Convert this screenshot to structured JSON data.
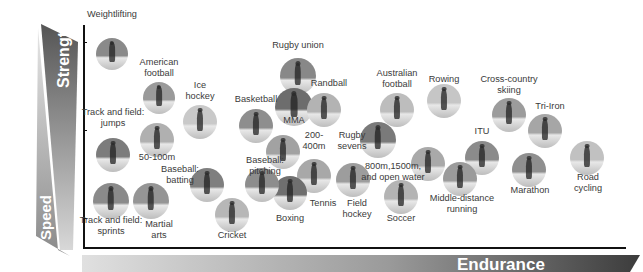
{
  "axes": {
    "y_top_label": "Strength",
    "y_bottom_label": "Speed",
    "x_label": "Endurance"
  },
  "sports": [
    {
      "id": "weightlifting",
      "label": "Weightlifting",
      "cx": 112,
      "cy": 54,
      "r": 16,
      "tone": "#8a8a8a"
    },
    {
      "id": "american-football",
      "label": "American\nfootball",
      "cx": 159,
      "cy": 98,
      "r": 16,
      "tone": "#9a9a9a"
    },
    {
      "id": "ice-hockey",
      "label": "Ice\nhockey",
      "cx": 200,
      "cy": 122,
      "r": 17,
      "tone": "#c9c9c9"
    },
    {
      "id": "track-field-jumps",
      "label": "Track and field:\njumps",
      "cx": 113,
      "cy": 155,
      "r": 17,
      "tone": "#7c7c7c"
    },
    {
      "id": "50-100m",
      "label": "50-100m",
      "cx": 157,
      "cy": 140,
      "r": 17,
      "tone": "#b0b0b0"
    },
    {
      "id": "basketball",
      "label": "Basketball",
      "cx": 256,
      "cy": 126,
      "r": 17,
      "tone": "#8e8e8e"
    },
    {
      "id": "rugby-union",
      "label": "Rugby union",
      "cx": 298,
      "cy": 76,
      "r": 18,
      "tone": "#888888"
    },
    {
      "id": "mma",
      "label": "MMA",
      "cx": 294,
      "cy": 107,
      "r": 19,
      "tone": "#6d6d6d"
    },
    {
      "id": "randball",
      "label": "Randball",
      "cx": 324,
      "cy": 110,
      "r": 17,
      "tone": "#b3b3b3"
    },
    {
      "id": "200-400m",
      "label": "200-\n400m",
      "cx": 283,
      "cy": 152,
      "r": 17,
      "tone": "#a2a2a2"
    },
    {
      "id": "rugby-sevens",
      "label": "Rugby\nsevens",
      "cx": 378,
      "cy": 140,
      "r": 18,
      "tone": "#7a7a7a"
    },
    {
      "id": "australian-football",
      "label": "Australian\nfootball",
      "cx": 397,
      "cy": 110,
      "r": 17,
      "tone": "#bdbdbd"
    },
    {
      "id": "rowing",
      "label": "Rowing",
      "cx": 444,
      "cy": 101,
      "r": 17,
      "tone": "#c6c6c6"
    },
    {
      "id": "cross-country-skiing",
      "label": "Cross-country\nskiing",
      "cx": 509,
      "cy": 115,
      "r": 17,
      "tone": "#9c9c9c"
    },
    {
      "id": "tri-iron",
      "label": "Tri-Iron",
      "cx": 545,
      "cy": 131,
      "r": 17,
      "tone": "#a6a6a6"
    },
    {
      "id": "road-cycling",
      "label": "Road\ncycling",
      "cx": 587,
      "cy": 158,
      "r": 17,
      "tone": "#c1c1c1"
    },
    {
      "id": "marathon",
      "label": "Marathon",
      "cx": 529,
      "cy": 170,
      "r": 17,
      "tone": "#8f8f8f"
    },
    {
      "id": "itu",
      "label": "ITU",
      "cx": 482,
      "cy": 158,
      "r": 17,
      "tone": "#8b8b8b"
    },
    {
      "id": "middle-distance-running",
      "label": "Middle-distance\nrunning",
      "cx": 460,
      "cy": 179,
      "r": 17,
      "tone": "#9b9b9b"
    },
    {
      "id": "800m-1500m-open-water",
      "label": "800m,1500m,\nand open water",
      "cx": 428,
      "cy": 164,
      "r": 17,
      "tone": "#a9a9a9"
    },
    {
      "id": "soccer",
      "label": "Soccer",
      "cx": 401,
      "cy": 197,
      "r": 17,
      "tone": "#b4b4b4"
    },
    {
      "id": "field-hockey",
      "label": "Field\nhockey",
      "cx": 353,
      "cy": 180,
      "r": 17,
      "tone": "#9d9d9d"
    },
    {
      "id": "tennis",
      "label": "Tennis",
      "cx": 314,
      "cy": 176,
      "r": 17,
      "tone": "#a8a8a8"
    },
    {
      "id": "boxing",
      "label": "Boxing",
      "cx": 290,
      "cy": 193,
      "r": 17,
      "tone": "#6f6f6f"
    },
    {
      "id": "baseball-pitching",
      "label": "Baseball:\npitching",
      "cx": 262,
      "cy": 185,
      "r": 17,
      "tone": "#8d8d8d"
    },
    {
      "id": "cricket",
      "label": "Cricket",
      "cx": 232,
      "cy": 215,
      "r": 17,
      "tone": "#b7b7b7"
    },
    {
      "id": "baseball-batting",
      "label": "Baseball:\nbatting",
      "cx": 207,
      "cy": 185,
      "r": 17,
      "tone": "#7f7f7f"
    },
    {
      "id": "martial-arts",
      "label": "Martial\narts",
      "cx": 151,
      "cy": 201,
      "r": 18,
      "tone": "#959595"
    },
    {
      "id": "track-field-sprints",
      "label": "Track and field:\nsprints",
      "cx": 111,
      "cy": 201,
      "r": 18,
      "tone": "#8a8a8a"
    }
  ],
  "labels": [
    {
      "for": "weightlifting",
      "text": "Weightlifting",
      "x": 112,
      "y": 15
    },
    {
      "for": "american-football",
      "text": "American",
      "x": 159,
      "y": 63
    },
    {
      "for": "american-football",
      "text": "football",
      "x": 159,
      "y": 74
    },
    {
      "for": "ice-hockey",
      "text": "Ice",
      "x": 200,
      "y": 86
    },
    {
      "for": "ice-hockey",
      "text": "hockey",
      "x": 200,
      "y": 97
    },
    {
      "for": "track-field-jumps",
      "text": "Track and field:",
      "x": 113,
      "y": 113
    },
    {
      "for": "track-field-jumps",
      "text": "jumps",
      "x": 113,
      "y": 124
    },
    {
      "for": "50-100m",
      "text": "50-100m",
      "x": 157,
      "y": 158
    },
    {
      "for": "basketball",
      "text": "Basketball",
      "x": 256,
      "y": 100
    },
    {
      "for": "rugby-union",
      "text": "Rugby union",
      "x": 298,
      "y": 46
    },
    {
      "for": "mma",
      "text": "MMA",
      "x": 294,
      "y": 121
    },
    {
      "for": "randball",
      "text": "Randball",
      "x": 329,
      "y": 84
    },
    {
      "for": "200-400m",
      "text": "200-",
      "x": 314,
      "y": 136
    },
    {
      "for": "200-400m",
      "text": "400m",
      "x": 314,
      "y": 147
    },
    {
      "for": "rugby-sevens",
      "text": "Rugby",
      "x": 352,
      "y": 136
    },
    {
      "for": "rugby-sevens",
      "text": "sevens",
      "x": 352,
      "y": 147
    },
    {
      "for": "australian-football",
      "text": "Australian",
      "x": 397,
      "y": 74
    },
    {
      "for": "australian-football",
      "text": "football",
      "x": 397,
      "y": 85
    },
    {
      "for": "rowing",
      "text": "Rowing",
      "x": 444,
      "y": 80
    },
    {
      "for": "cross-country-skiing",
      "text": "Cross-country",
      "x": 509,
      "y": 80
    },
    {
      "for": "cross-country-skiing",
      "text": "skiing",
      "x": 509,
      "y": 91
    },
    {
      "for": "tri-iron",
      "text": "Tri-Iron",
      "x": 550,
      "y": 107
    },
    {
      "for": "road-cycling",
      "text": "Road",
      "x": 588,
      "y": 178
    },
    {
      "for": "road-cycling",
      "text": "cycling",
      "x": 588,
      "y": 189
    },
    {
      "for": "marathon",
      "text": "Marathon",
      "x": 530,
      "y": 191
    },
    {
      "for": "itu",
      "text": "ITU",
      "x": 482,
      "y": 132
    },
    {
      "for": "middle-distance-running",
      "text": "Middle-distance",
      "x": 462,
      "y": 199
    },
    {
      "for": "middle-distance-running",
      "text": "running",
      "x": 462,
      "y": 210
    },
    {
      "for": "800m-1500m-open-water",
      "text": "800m,1500m,",
      "x": 393,
      "y": 167
    },
    {
      "for": "800m-1500m-open-water",
      "text": "and open water",
      "x": 393,
      "y": 178
    },
    {
      "for": "soccer",
      "text": "Soccer",
      "x": 401,
      "y": 219
    },
    {
      "for": "field-hockey",
      "text": "Field",
      "x": 357,
      "y": 204
    },
    {
      "for": "field-hockey",
      "text": "hockey",
      "x": 357,
      "y": 215
    },
    {
      "for": "tennis",
      "text": "Tennis",
      "x": 323,
      "y": 204
    },
    {
      "for": "boxing",
      "text": "Boxing",
      "x": 290,
      "y": 219
    },
    {
      "for": "baseball-pitching",
      "text": "Baseball:",
      "x": 265,
      "y": 161
    },
    {
      "for": "baseball-pitching",
      "text": "pitching",
      "x": 265,
      "y": 172
    },
    {
      "for": "cricket",
      "text": "Cricket",
      "x": 232,
      "y": 236
    },
    {
      "for": "baseball-batting",
      "text": "Baseball:",
      "x": 180,
      "y": 170
    },
    {
      "for": "baseball-batting",
      "text": "batting",
      "x": 180,
      "y": 181
    },
    {
      "for": "martial-arts",
      "text": "Martial",
      "x": 159,
      "y": 225
    },
    {
      "for": "martial-arts",
      "text": "arts",
      "x": 159,
      "y": 236
    },
    {
      "for": "track-field-sprints",
      "text": "Track and field:",
      "x": 111,
      "y": 221
    },
    {
      "for": "track-field-sprints",
      "text": "sprints",
      "x": 111,
      "y": 232
    }
  ]
}
